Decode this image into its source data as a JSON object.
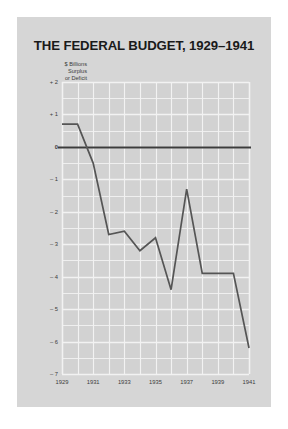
{
  "figure": {
    "background_color": "#d6d6d6",
    "plot_background_color": "#d2d2d2"
  },
  "chart_data": {
    "type": "line",
    "title": "THE FEDERAL BUDGET, 1929–1941",
    "ylabel_lines": [
      "$ Billions",
      "Surplus",
      "or Deficit"
    ],
    "xlabel": "",
    "ylabel": "$ Billions Surplus or Deficit",
    "x": [
      1929,
      1930,
      1931,
      1932,
      1933,
      1934,
      1935,
      1936,
      1937,
      1938,
      1939,
      1940,
      1941
    ],
    "values": [
      0.7,
      0.7,
      -0.5,
      -2.7,
      -2.6,
      -3.2,
      -2.8,
      -4.4,
      -1.3,
      -3.9,
      -3.9,
      -3.9,
      -6.2
    ],
    "series": [
      {
        "name": "Federal surplus or deficit",
        "values": [
          0.7,
          0.7,
          -0.5,
          -2.7,
          -2.6,
          -3.2,
          -2.8,
          -4.4,
          -1.3,
          -3.9,
          -3.9,
          -3.9,
          -6.2
        ],
        "color": "#555555"
      }
    ],
    "xlim": [
      1929,
      1941
    ],
    "ylim": [
      -7,
      2
    ],
    "ytick_labels": [
      "+ 2",
      "+ 1",
      "0",
      "– 1",
      "– 2",
      "– 3",
      "– 4",
      "– 5",
      "– 6",
      "– 7"
    ],
    "ytick_values": [
      2,
      1,
      0,
      -1,
      -2,
      -3,
      -4,
      -5,
      -6,
      -7
    ],
    "xtick_labels": [
      "1929",
      "1931",
      "1933",
      "1935",
      "1937",
      "1939",
      "1941"
    ],
    "xtick_values": [
      1929,
      1931,
      1933,
      1935,
      1937,
      1939,
      1941
    ],
    "grid": true,
    "grid_color": "#f2f2f2",
    "grid_x_step": 1,
    "grid_y_step": 0.5,
    "zero_line": 0,
    "zero_line_color": "#3c3c3c",
    "legend": "none",
    "line_color": "#555555"
  }
}
